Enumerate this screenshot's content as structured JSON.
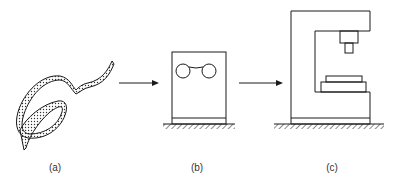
{
  "figure": {
    "panels": [
      {
        "id": "a",
        "label": "(a)",
        "description": "coiled strip / tape"
      },
      {
        "id": "b",
        "label": "(b)",
        "description": "roll-feed machine with two rollers"
      },
      {
        "id": "c",
        "label": "(c)",
        "description": "C-frame press with ram and die"
      }
    ],
    "arrows": [
      {
        "from": "a",
        "to": "b"
      },
      {
        "from": "b",
        "to": "c"
      }
    ],
    "colors": {
      "stroke": "#1a1a1a",
      "background": "#ffffff"
    }
  }
}
